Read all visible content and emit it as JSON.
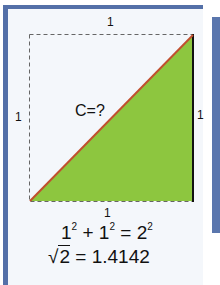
{
  "diagram": {
    "title_implied": "Pythagorean unit square diagonal",
    "labels": {
      "top": "1",
      "left": "1",
      "right": "1",
      "bottom": "1",
      "hypotenuse": "C=?"
    },
    "equation": {
      "lhs_a": "1",
      "lhs_a_exp": "2",
      "plus": "+",
      "lhs_b": "1",
      "lhs_b_exp": "2",
      "equals": "=",
      "rhs": "2",
      "rhs_exp": "2"
    },
    "sqrt_line": {
      "radical": "√",
      "radicand": "2",
      "result": "= 1.4142"
    },
    "colors": {
      "frame_border": "#5470a8",
      "triangle_fill": "#8dc63f",
      "hypotenuse": "#c0502e",
      "side": "#111111",
      "dashed": "#555555"
    }
  }
}
